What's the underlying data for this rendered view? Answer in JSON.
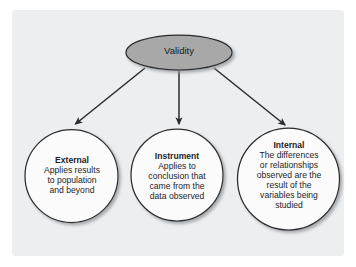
{
  "figure": {
    "type": "hierarchy-diagram",
    "canvas": {
      "width": 356,
      "height": 267
    },
    "background_color": "#ffffff",
    "panel_color": "#eceef0",
    "stroke_color": "#2b2b2b",
    "root_fill_color": "#a8a8a8",
    "leaf_fill_color": "#fbfbfb"
  },
  "root": {
    "shape": "ellipse",
    "label": "Validity"
  },
  "connectors": [
    {
      "name": "arrow-to-external",
      "from": "Validity",
      "to": "External",
      "direction": "down-left"
    },
    {
      "name": "arrow-to-instrument",
      "from": "Validity",
      "to": "Instrument",
      "direction": "down"
    },
    {
      "name": "arrow-to-internal",
      "from": "Validity",
      "to": "Internal",
      "direction": "down-right"
    }
  ],
  "nodes": [
    {
      "id": "external",
      "shape": "circle",
      "title": "External",
      "lines": [
        "Applies results",
        "to population",
        "and beyond"
      ]
    },
    {
      "id": "instrument",
      "shape": "circle",
      "title": "Instrument",
      "lines": [
        "Applies to",
        "conclusion that",
        "came from the",
        "data observed"
      ]
    },
    {
      "id": "internal",
      "shape": "circle",
      "title": "Internal",
      "lines": [
        "The differences",
        "or relationships",
        "observed are the",
        "result of the",
        "variables being",
        "studied"
      ]
    }
  ]
}
